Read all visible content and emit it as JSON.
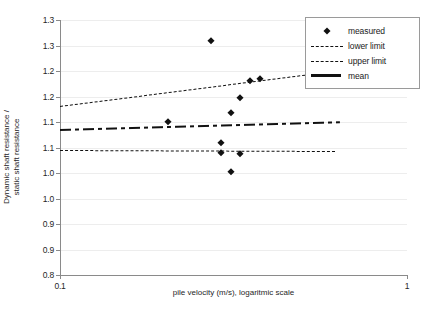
{
  "chart_data": {
    "type": "scatter",
    "title": "",
    "xlabel": "pile velocity (m/s), logaritmic scale",
    "ylabel": "Dynamic shaft resistance / static shaft resistance",
    "ylabel_line1": "Dynamic shaft resistance /",
    "ylabel_line2": "static shaft resistance",
    "xscale": "log",
    "xlim": [
      0.1,
      1
    ],
    "ylim": [
      0.8,
      1.3
    ],
    "grid": true,
    "legend_position": "top-right",
    "xticks": [
      {
        "value": 0.1,
        "label": "0.1"
      },
      {
        "value": 1,
        "label": "1"
      }
    ],
    "yticks": [
      {
        "value": 1.3,
        "label": "1.3"
      },
      {
        "value": 1.25,
        "label": "1.3"
      },
      {
        "value": 1.2,
        "label": "1.2"
      },
      {
        "value": 1.15,
        "label": "1.2"
      },
      {
        "value": 1.1,
        "label": "1.1"
      },
      {
        "value": 1.05,
        "label": "1.1"
      },
      {
        "value": 1.0,
        "label": "1.0"
      },
      {
        "value": 0.95,
        "label": "1.0"
      },
      {
        "value": 0.9,
        "label": "0.9"
      },
      {
        "value": 0.85,
        "label": "0.9"
      },
      {
        "value": 0.8,
        "label": "0.8"
      }
    ],
    "series": [
      {
        "name": "measured",
        "type": "scatter",
        "marker": "diamond",
        "color": "#111111",
        "points": [
          {
            "x": 0.272,
            "y": 1.259
          },
          {
            "x": 0.352,
            "y": 1.18
          },
          {
            "x": 0.378,
            "y": 1.184
          },
          {
            "x": 0.33,
            "y": 1.148
          },
          {
            "x": 0.31,
            "y": 1.118
          },
          {
            "x": 0.205,
            "y": 1.1
          },
          {
            "x": 0.292,
            "y": 1.058
          },
          {
            "x": 0.292,
            "y": 1.04
          },
          {
            "x": 0.33,
            "y": 1.038
          },
          {
            "x": 0.312,
            "y": 1.002
          }
        ]
      },
      {
        "name": "upper limit",
        "type": "line",
        "style": "dashed",
        "color": "#111111",
        "points": [
          {
            "x": 0.1,
            "y": 1.131
          },
          {
            "x": 0.62,
            "y": 1.2
          }
        ]
      },
      {
        "name": "mean",
        "type": "line",
        "style": "dash-dot",
        "color": "#111111",
        "points": [
          {
            "x": 0.1,
            "y": 1.086
          },
          {
            "x": 0.64,
            "y": 1.101
          }
        ]
      },
      {
        "name": "lower limit",
        "type": "line",
        "style": "dashed",
        "color": "#111111",
        "points": [
          {
            "x": 0.1,
            "y": 1.046
          },
          {
            "x": 0.62,
            "y": 1.044
          }
        ]
      }
    ],
    "legend": [
      {
        "label": "measured",
        "key": "diamond-marker"
      },
      {
        "label": "lower limit",
        "key": "dashed-line"
      },
      {
        "label": "upper limit",
        "key": "dashed-line"
      },
      {
        "label": "mean",
        "key": "solid-line"
      }
    ]
  }
}
